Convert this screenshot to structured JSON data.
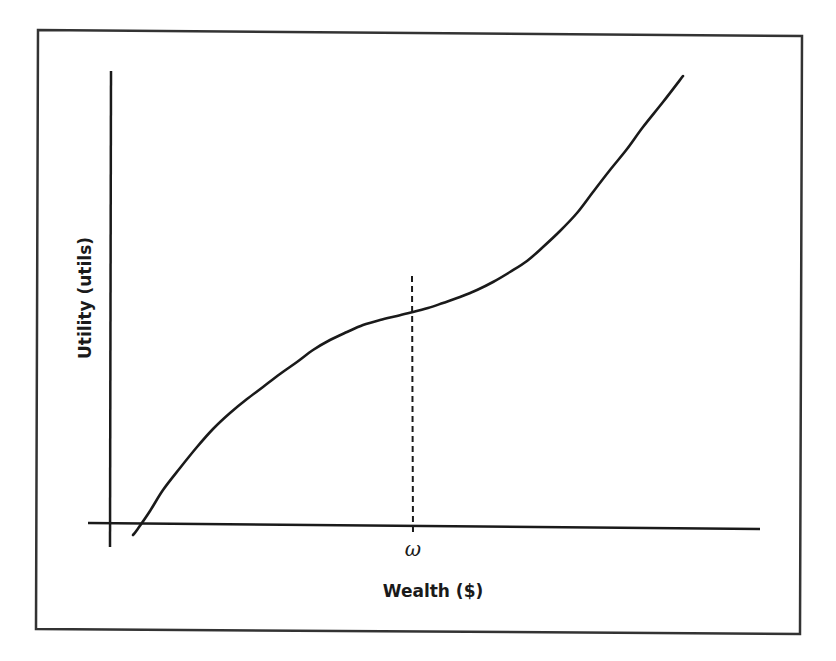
{
  "chart_data": {
    "type": "line",
    "title": "",
    "xlabel": "Wealth ($)",
    "ylabel": "Utility (utils)",
    "x_ticks": [
      {
        "label": "ω",
        "position": "inflection point",
        "marker": "dashed vertical line"
      }
    ],
    "y_ticks": [],
    "grid": false,
    "legend": null,
    "series": [
      {
        "name": "Utility curve",
        "style": "solid",
        "color": "#1a1a1a",
        "points_px": [
          [
            133,
            535
          ],
          [
            137,
            530
          ],
          [
            150,
            511
          ],
          [
            163,
            490
          ],
          [
            180,
            468
          ],
          [
            197,
            447
          ],
          [
            213,
            429
          ],
          [
            230,
            413
          ],
          [
            247,
            399
          ],
          [
            263,
            387
          ],
          [
            280,
            374
          ],
          [
            297,
            362
          ],
          [
            313,
            350
          ],
          [
            330,
            340
          ],
          [
            347,
            332
          ],
          [
            363,
            325
          ],
          [
            380,
            320
          ],
          [
            397,
            316
          ],
          [
            413,
            312
          ],
          [
            428,
            308
          ],
          [
            443,
            303
          ],
          [
            460,
            297
          ],
          [
            477,
            290
          ],
          [
            493,
            282
          ],
          [
            510,
            272
          ],
          [
            527,
            261
          ],
          [
            543,
            247
          ],
          [
            560,
            231
          ],
          [
            577,
            213
          ],
          [
            593,
            192
          ],
          [
            610,
            170
          ],
          [
            627,
            149
          ],
          [
            643,
            127
          ],
          [
            663,
            102
          ],
          [
            683,
            76
          ]
        ]
      }
    ],
    "reference_lines": [
      {
        "name": "omega-marker",
        "type": "vertical",
        "style": "dashed",
        "x_px": 412,
        "y_from_px": 276,
        "y_to_px": 535,
        "label": "ω"
      }
    ],
    "axes_px": {
      "y_axis": {
        "x": 111,
        "y_top": 71,
        "y_bottom": 547
      },
      "x_axis": {
        "y_left": 523,
        "y_right": 529,
        "x_left": 88,
        "x_right": 760
      }
    },
    "frame_px": {
      "top_left": [
        38,
        30
      ],
      "top_right": [
        802,
        36
      ],
      "bottom_right": [
        800,
        634
      ],
      "bottom_left": [
        36,
        629
      ]
    }
  },
  "labels": {
    "x_axis": "Wealth ($)",
    "y_axis": "Utility (utils)",
    "omega": "ω"
  },
  "colors": {
    "ink": "#1a1a1a",
    "frame": "#333333",
    "background": "#ffffff"
  }
}
